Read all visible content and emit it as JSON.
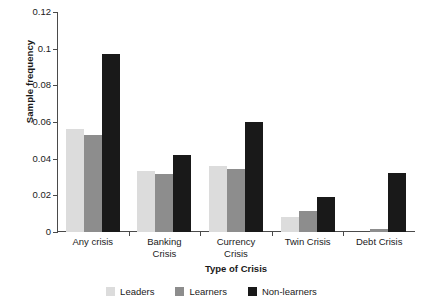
{
  "chart_data": {
    "type": "bar",
    "title": "",
    "xlabel": "Type of Crisis",
    "ylabel": "Sample frequency",
    "categories": [
      "Any crisis",
      "Banking Crisis",
      "Currency Crisis",
      "Twin Crisis",
      "Debt Crisis"
    ],
    "category_lines": [
      [
        "Any crisis"
      ],
      [
        "Banking",
        "Crisis"
      ],
      [
        "Currency",
        "Crisis"
      ],
      [
        "Twin Crisis"
      ],
      [
        "Debt Crisis"
      ]
    ],
    "series": [
      {
        "name": "Leaders",
        "color": "#dcdcdc",
        "values": [
          0.056,
          0.0335,
          0.036,
          0.008,
          0.0
        ]
      },
      {
        "name": "Learners",
        "color": "#8d8d8d",
        "values": [
          0.053,
          0.0315,
          0.0345,
          0.0115,
          0.0015
        ]
      },
      {
        "name": "Non-learners",
        "color": "#191919",
        "values": [
          0.097,
          0.042,
          0.06,
          0.019,
          0.032
        ]
      }
    ],
    "ylim": [
      0,
      0.12
    ],
    "yticks": [
      0,
      0.02,
      0.04,
      0.06,
      0.08,
      0.1,
      0.12
    ],
    "ytick_labels": [
      "0",
      "0.02",
      "0.04",
      "0.06",
      "0.08",
      "0.1",
      "0.12"
    ],
    "grid": false,
    "legend_position": "bottom"
  },
  "axis": {
    "y_title": "Sample frequency",
    "x_title": "Type of Crisis"
  },
  "legend": {
    "items": [
      {
        "label": "Leaders",
        "color": "#dcdcdc"
      },
      {
        "label": "Learners",
        "color": "#8d8d8d"
      },
      {
        "label": "Non-learners",
        "color": "#191919"
      }
    ]
  }
}
